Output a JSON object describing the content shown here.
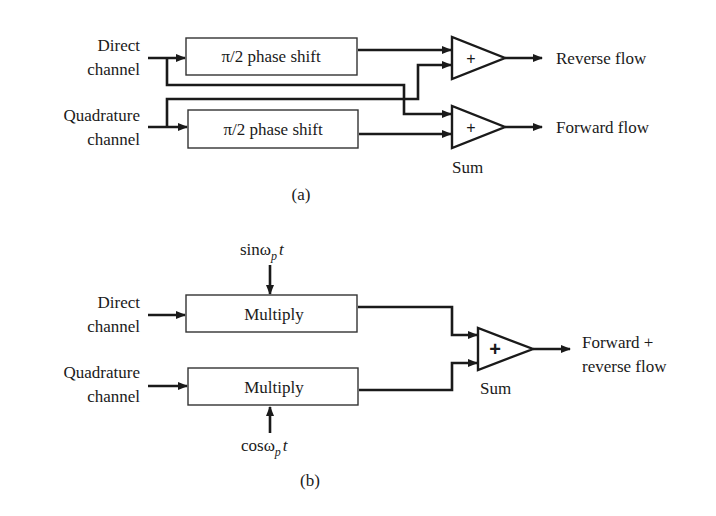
{
  "diagram_a": {
    "inputs": {
      "direct": [
        "Direct",
        "channel"
      ],
      "quadrature": [
        "Quadrature",
        "channel"
      ]
    },
    "blocks": {
      "top": "π/2 phase shift",
      "bottom": "π/2 phase shift"
    },
    "summers": {
      "top_sign": "+",
      "bottom_sign": "+",
      "label": "Sum"
    },
    "outputs": {
      "top": "Reverse flow",
      "bottom": "Forward flow"
    },
    "caption": "(a)"
  },
  "diagram_b": {
    "inputs": {
      "direct": [
        "Direct",
        "channel"
      ],
      "quadrature": [
        "Quadrature",
        "channel"
      ]
    },
    "blocks": {
      "top": "Multiply",
      "bottom": "Multiply"
    },
    "references": {
      "top": {
        "prefix": "sinω",
        "subscript": "p",
        "suffix": "t"
      },
      "bottom": {
        "prefix": "cosω",
        "subscript": "p",
        "suffix": "t"
      }
    },
    "summer": {
      "sign": "+",
      "label": "Sum"
    },
    "output": [
      "Forward +",
      "reverse flow"
    ],
    "caption": "(b)"
  }
}
